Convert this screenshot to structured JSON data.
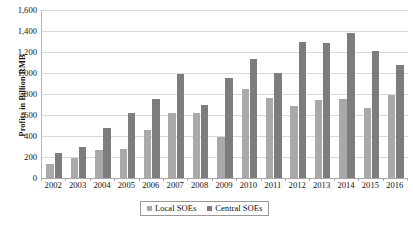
{
  "chart_data": {
    "type": "bar",
    "title": "",
    "xlabel": "",
    "ylabel": "Profits in Billion RMB",
    "ylim": [
      0,
      1600
    ],
    "ytick_step": 200,
    "grid": true,
    "legend_position": "bottom",
    "categories": [
      "2002",
      "2003",
      "2004",
      "2005",
      "2006",
      "2007",
      "2008",
      "2009",
      "2010",
      "2011",
      "2012",
      "2013",
      "2014",
      "2015",
      "2016"
    ],
    "ytick_labels": [
      "1,600",
      "1,400",
      "1,200",
      "1,000",
      "800",
      "600",
      "400",
      "200",
      "0"
    ],
    "ytick_values": [
      1600,
      1400,
      1200,
      1000,
      800,
      600,
      400,
      200,
      0
    ],
    "series": [
      {
        "name": "Local SOEs",
        "color": "#a9a9a9",
        "values": [
          130,
          190,
          270,
          275,
          460,
          615,
          620,
          390,
          850,
          760,
          690,
          740,
          750,
          670,
          790
        ]
      },
      {
        "name": "Central SOEs",
        "color": "#7d7d7d",
        "values": [
          240,
          295,
          475,
          615,
          750,
          990,
          700,
          955,
          1135,
          1000,
          1300,
          1290,
          1380,
          1210,
          1080
        ]
      }
    ]
  },
  "legend": {
    "entries": [
      {
        "label": "Local SOEs"
      },
      {
        "label": "Central SOEs"
      }
    ]
  }
}
